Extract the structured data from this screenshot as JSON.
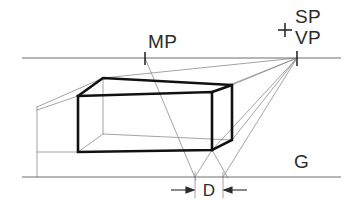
{
  "figure": {
    "type": "perspective-construction-diagram",
    "title_visible": false,
    "background_color": "#ffffff",
    "line_color_heavy": "#111111",
    "line_color_light": "#8c8c8c",
    "text_color": "#2b2b2b"
  },
  "labels": {
    "measuring_point": "MP",
    "station_point": "SP",
    "vanishing_point": "VP",
    "ground_line": "G",
    "depth_dimension": "D"
  },
  "geometry": {
    "horizon_line": {
      "x1": 22,
      "y1": 58,
      "x2": 341,
      "y2": 58
    },
    "ground_line": {
      "x1": 22,
      "y1": 177,
      "x2": 341,
      "y2": 177
    },
    "measuring_point": {
      "x": 145,
      "y": 58
    },
    "vanishing_point": {
      "x": 297,
      "y": 58
    },
    "station_point_cross": {
      "x": 285,
      "y": 30
    },
    "dimension_line_y": 190,
    "dimension_left_x": 195,
    "dimension_right_x": 223,
    "box_front_top_left": {
      "x": 78,
      "y": 96
    },
    "box_front_top_right": {
      "x": 212,
      "y": 92
    },
    "box_front_bottom_left": {
      "x": 78,
      "y": 152
    },
    "box_front_bottom_right": {
      "x": 212,
      "y": 150
    },
    "box_back_top_left": {
      "x": 103,
      "y": 78
    },
    "box_back_top_right": {
      "x": 232,
      "y": 85
    },
    "box_back_bottom_right": {
      "x": 232,
      "y": 140
    },
    "left_construction_vertical_x": 37
  }
}
